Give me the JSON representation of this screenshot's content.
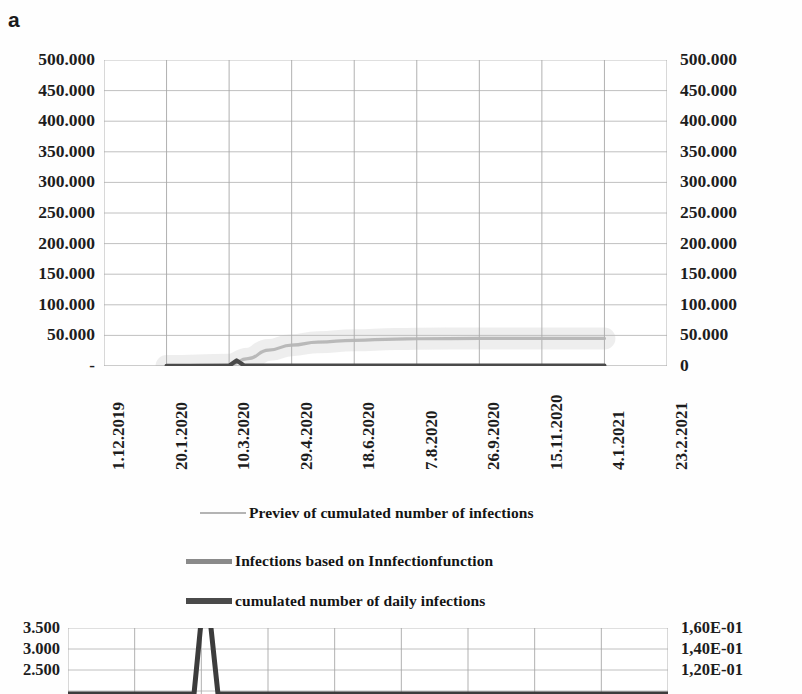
{
  "panels": {
    "a": {
      "letter": "a"
    },
    "b": {
      "letter": "b"
    }
  },
  "legend": {
    "items": [
      {
        "label": "Previev of cumulated number of infections",
        "color": "#b4b4b4",
        "thickness": 2
      },
      {
        "label": "Infections based on Innfectionfunction",
        "color": "#8a8a8a",
        "thickness": 5
      },
      {
        "label": "cumulated number of daily infections",
        "color": "#4a4a4a",
        "thickness": 6
      }
    ]
  },
  "chart_data": [
    {
      "type": "line",
      "panel": "a",
      "title": "",
      "xlabel": "",
      "ylabel": "",
      "grid": true,
      "legend_position": "below",
      "x_ticklabels": [
        "1.12.2019",
        "20.1.2020",
        "10.3.2020",
        "29.4.2020",
        "18.6.2020",
        "7.8.2020",
        "26.9.2020",
        "15.11.2020",
        "4.1.2021",
        "23.2.2021"
      ],
      "y_left_ticklabels": [
        "500.000",
        "450.000",
        "400.000",
        "350.000",
        "300.000",
        "250.000",
        "200.000",
        "150.000",
        "100.000",
        "50.000",
        "-"
      ],
      "y_right_ticklabels": [
        "500.000",
        "450.000",
        "400.000",
        "350.000",
        "300.000",
        "250.000",
        "200.000",
        "150.000",
        "100.000",
        "50.000",
        "0"
      ],
      "ylim": [
        0,
        500000
      ],
      "y_tick_step": 50000,
      "series": [
        {
          "name": "Previev of cumulated number of infections",
          "color": "#b4b4b4",
          "x": [
            "20.1.2020",
            "10.3.2020",
            "25.3.2020",
            "10.4.2020",
            "29.4.2020",
            "20.5.2020",
            "18.6.2020",
            "20.7.2020",
            "7.8.2020",
            "26.9.2020",
            "15.11.2020",
            "4.1.2021"
          ],
          "values": [
            0,
            2000,
            12000,
            26000,
            34000,
            39000,
            42000,
            44000,
            44500,
            45000,
            45000,
            45000
          ]
        },
        {
          "name": "cumulated number of daily infections",
          "color": "#4a4a4a",
          "x": [
            "20.1.2020",
            "10.3.2020",
            "16.3.2020",
            "22.3.2020",
            "29.4.2020",
            "18.6.2020",
            "7.8.2020",
            "26.9.2020",
            "15.11.2020",
            "4.1.2021"
          ],
          "values": [
            200,
            300,
            9000,
            800,
            500,
            500,
            500,
            500,
            500,
            600
          ]
        }
      ]
    },
    {
      "type": "line",
      "panel": "b",
      "title": "",
      "xlabel": "",
      "ylabel": "",
      "grid": true,
      "y_left_ticklabels": [
        "3.500",
        "3.000",
        "2.500"
      ],
      "y_right_ticklabels": [
        "1,60E-01",
        "1,40E-01",
        "1,20E-01"
      ],
      "ylim": [
        2500,
        3500
      ],
      "y_tick_step": 500,
      "series": [
        {
          "name": "daily infections peak",
          "color": "#3c3c3c",
          "x": [
            0,
            0.21,
            0.225,
            0.235,
            0.25,
            1.0
          ],
          "values": [
            0,
            0,
            3150,
            2900,
            0,
            0
          ]
        }
      ]
    }
  ]
}
